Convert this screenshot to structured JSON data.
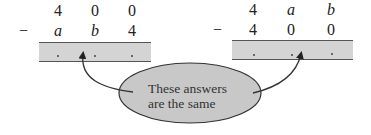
{
  "left_problem": {
    "top_row": [
      "4",
      "0",
      "0"
    ],
    "operator": "−",
    "bottom_row": [
      "a",
      "b",
      "4"
    ],
    "answer_placeholders": [
      ".",
      ".",
      "."
    ]
  },
  "right_problem": {
    "top_row": [
      "4",
      "a",
      "b"
    ],
    "operator": "−",
    "bottom_row": [
      "4",
      "0",
      "0"
    ],
    "answer_placeholders": [
      ".",
      ".",
      "."
    ]
  },
  "callout": {
    "line1": "These answers",
    "line2": "are the same"
  },
  "colors": {
    "box_fill": "#d4d4d4",
    "ellipse_fill": "#c8c8c8",
    "line": "#333333"
  }
}
